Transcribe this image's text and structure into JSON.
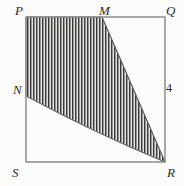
{
  "figure": {
    "type": "geometry-diagram",
    "background_color": "#fbfbf9",
    "outline_color": "#8d8d8d",
    "hatch_color": "#3a3a3a",
    "shade_fill_color": "#d9d9d9",
    "labels": {
      "P": "P",
      "M": "M",
      "Q": "Q",
      "N": "N",
      "S": "S",
      "R": "R",
      "side_right": "4"
    },
    "points": {
      "P": {
        "x": 26,
        "y": 17
      },
      "Q": {
        "x": 165,
        "y": 17
      },
      "R": {
        "x": 165,
        "y": 162
      },
      "S": {
        "x": 26,
        "y": 162
      },
      "M": {
        "x": 102,
        "y": 17
      },
      "N": {
        "x": 26,
        "y": 96
      }
    },
    "segments": [
      {
        "name": "PQ",
        "from": "P",
        "to": "Q"
      },
      {
        "name": "QR",
        "from": "Q",
        "to": "R"
      },
      {
        "name": "RS",
        "from": "R",
        "to": "S"
      },
      {
        "name": "SP",
        "from": "S",
        "to": "P"
      },
      {
        "name": "MR",
        "from": "M",
        "to": "R"
      },
      {
        "name": "NR",
        "from": "N",
        "to": "R"
      }
    ],
    "shaded_region": {
      "name": "PMRN",
      "vertices": [
        "P",
        "M",
        "R",
        "N"
      ],
      "hatch_direction": "vertical",
      "hatch_spacing_px": 3
    }
  }
}
